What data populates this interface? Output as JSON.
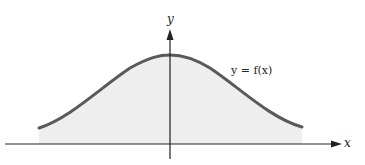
{
  "diagram": {
    "type": "function-graph",
    "x_axis_label": "x",
    "y_axis_label": "y",
    "curve_label": "y = f(x)",
    "colors": {
      "curve": "#5a5a5a",
      "fill": "#eeeeee",
      "axes": "#222222"
    }
  }
}
